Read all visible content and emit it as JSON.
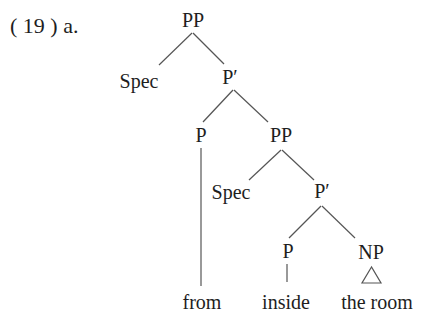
{
  "example_label": "( 19 ) a.",
  "tree": {
    "nodes": {
      "pp_root": "PP",
      "spec_1": "Spec",
      "pbar_1": "P′",
      "p_1": "P",
      "pp_2": "PP",
      "spec_2": "Spec",
      "pbar_2": "P′",
      "p_2": "P",
      "np": "NP"
    },
    "leaves": {
      "from": "from",
      "inside": "inside",
      "the_room": "the room"
    },
    "edges": [
      [
        "pp_root",
        "spec_1"
      ],
      [
        "pp_root",
        "pbar_1"
      ],
      [
        "pbar_1",
        "p_1"
      ],
      [
        "pbar_1",
        "pp_2"
      ],
      [
        "pp_2",
        "spec_2"
      ],
      [
        "pp_2",
        "pbar_2"
      ],
      [
        "pbar_2",
        "p_2"
      ],
      [
        "pbar_2",
        "np"
      ],
      [
        "p_1",
        "from"
      ],
      [
        "p_2",
        "inside"
      ],
      [
        "np",
        "the_room",
        "triangle"
      ]
    ]
  }
}
